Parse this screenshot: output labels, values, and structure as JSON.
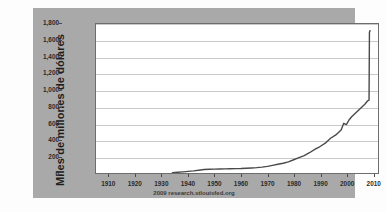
{
  "chart_data": {
    "type": "line",
    "title": "",
    "subtitle": "",
    "xlabel": "",
    "ylabel": "Miles de millones de dólares",
    "source_note": "2009 research.stlouisfed.org",
    "xlim": [
      1905,
      2012
    ],
    "ylim": [
      0,
      1800
    ],
    "xticks": [
      "1910",
      "1920",
      "1930",
      "1940",
      "1950",
      "1960",
      "1970",
      "1980",
      "1990",
      "2000",
      "2010"
    ],
    "xtick_values": [
      1910,
      1920,
      1930,
      1940,
      1950,
      1960,
      1970,
      1980,
      1990,
      2000,
      2010
    ],
    "yticks": [
      "0",
      "200",
      "400",
      "600",
      "800",
      "1,000",
      "1,200",
      "1,400",
      "1,600",
      "1,800"
    ],
    "ytick_values": [
      0,
      200,
      400,
      600,
      800,
      1000,
      1200,
      1400,
      1600,
      1800
    ],
    "grid": true,
    "legend": "none",
    "line_color": "#4a4a4a",
    "plot_bg": "#ffffff",
    "frame_color": "#a9a9a9",
    "series": [
      {
        "name": "Base monetaria",
        "x": [
          1934,
          1936,
          1938,
          1940,
          1942,
          1944,
          1946,
          1948,
          1950,
          1952,
          1954,
          1956,
          1958,
          1960,
          1962,
          1964,
          1966,
          1968,
          1970,
          1972,
          1974,
          1976,
          1978,
          1980,
          1982,
          1984,
          1986,
          1988,
          1990,
          1992,
          1994,
          1996,
          1998,
          1999,
          2000,
          2001,
          2002,
          2004,
          2006,
          2007,
          2008,
          2008.6,
          2008.75,
          2009
        ],
        "values": [
          5,
          9,
          14,
          20,
          26,
          34,
          42,
          45,
          47,
          49,
          50,
          52,
          53,
          54,
          57,
          61,
          65,
          71,
          80,
          92,
          105,
          118,
          135,
          160,
          185,
          210,
          245,
          285,
          320,
          360,
          420,
          460,
          520,
          600,
          585,
          640,
          680,
          740,
          800,
          830,
          870,
          880,
          1700,
          1720
        ]
      }
    ],
    "annotations": [
      {
        "label": "spike",
        "x": 2008.7,
        "y": 1720,
        "note": "Vertical spike in late 2008"
      }
    ]
  },
  "axis": {
    "y_title": "Miles de millones de dólares",
    "y_labels": [
      "1,800",
      "1,600",
      "1,400",
      "1,200",
      "1,000",
      "800",
      "600",
      "400",
      "200",
      "0"
    ],
    "x_labels": [
      "1910",
      "1920",
      "1930",
      "1940",
      "1950",
      "1960",
      "1970",
      "1980",
      "1990",
      "2000",
      "2010"
    ]
  },
  "footer": {
    "source": "2009 research.stlouisfed.org"
  }
}
